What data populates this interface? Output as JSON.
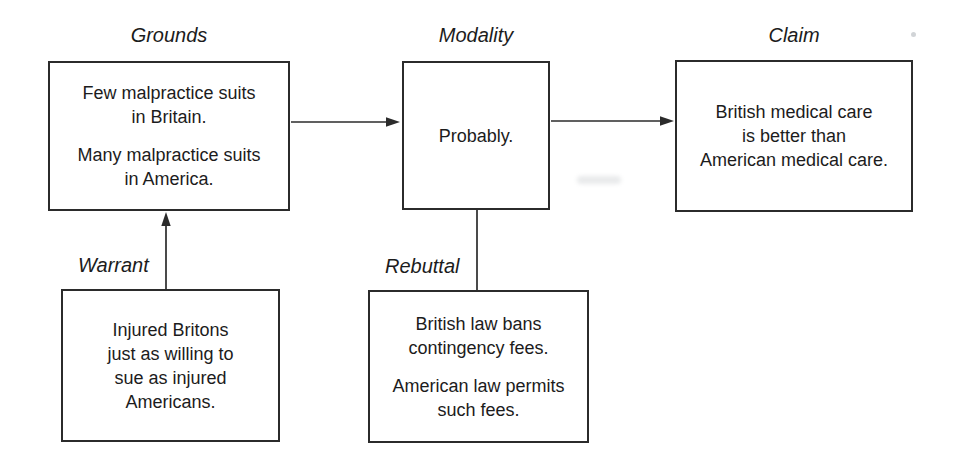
{
  "figure": {
    "type": "toulmin-argument-diagram"
  },
  "nodes": {
    "grounds": {
      "label": "Grounds",
      "lines": [
        [
          "Few malpractice suits",
          "in Britain."
        ],
        [
          "Many malpractice suits",
          "in America."
        ]
      ]
    },
    "modality": {
      "label": "Modality",
      "lines": [
        [
          "Probably."
        ]
      ]
    },
    "claim": {
      "label": "Claim",
      "lines": [
        [
          "British medical care",
          "is better than",
          "American medical care."
        ]
      ]
    },
    "warrant": {
      "label": "Warrant",
      "lines": [
        [
          "Injured Britons",
          "just as willing to",
          "sue as injured",
          "Americans."
        ]
      ]
    },
    "rebuttal": {
      "label": "Rebuttal",
      "lines": [
        [
          "British law bans",
          "contingency fees."
        ],
        [
          "American law permits",
          "such fees."
        ]
      ]
    }
  },
  "edges": [
    {
      "from": "grounds",
      "to": "modality",
      "connector": "arrow"
    },
    {
      "from": "modality",
      "to": "claim",
      "connector": "arrow"
    },
    {
      "from": "warrant",
      "to": "grounds",
      "connector": "arrow"
    },
    {
      "from": "modality",
      "to": "rebuttal",
      "connector": "line"
    }
  ],
  "colors": {
    "line": "#2b2b2b",
    "text": "#1c1c1c",
    "background": "#ffffff"
  }
}
